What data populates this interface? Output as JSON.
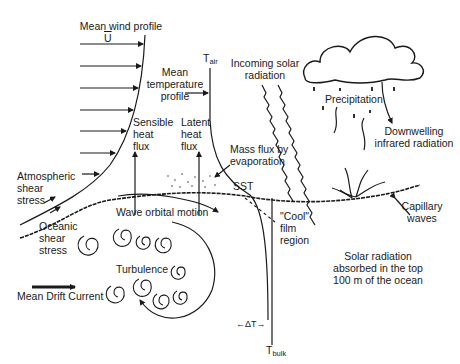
{
  "diagram": {
    "colors": {
      "ink": "#1a1a1a",
      "background": "#ffffff"
    },
    "labels": {
      "mean_wind_profile": "Mean wind profile",
      "u_bar": "U",
      "t_air_main": "T",
      "t_air_sub": "air",
      "mean_temp_profile_1": "Mean",
      "mean_temp_profile_2": "temperature",
      "mean_temp_profile_3": "profile",
      "sensible_1": "Sensible",
      "sensible_2": "heat",
      "sensible_3": "flux",
      "latent_1": "Latent",
      "latent_2": "heat",
      "latent_3": "flux",
      "mass_flux_1": "Mass flux by",
      "mass_flux_2": "evaporation",
      "incoming_solar_1": "Incoming solar",
      "incoming_solar_2": "radiation",
      "precipitation": "Precipitation",
      "downwelling_1": "Downwelling",
      "downwelling_2": "infrared radiation",
      "atm_shear_1": "Atmospheric",
      "atm_shear_2": "shear",
      "atm_shear_3": "stress",
      "ocean_shear_1": "Oceanic",
      "ocean_shear_2": "shear",
      "ocean_shear_3": "stress",
      "sst": "SST",
      "capillary_1": "Capillary",
      "capillary_2": "waves",
      "wave_orbital": "Wave orbital motion",
      "cool_film_1": "\"Cool\"",
      "cool_film_2": "film",
      "cool_film_3": "region",
      "turbulence": "Turbulence",
      "solar_absorbed_1": "Solar radiation",
      "solar_absorbed_2": "absorbed in the top",
      "solar_absorbed_3": "100 m of the ocean",
      "mean_drift": "Mean Drift Current",
      "delta_t": "←ΔT→",
      "t_bulk_main": "T",
      "t_bulk_sub": "bulk"
    }
  }
}
